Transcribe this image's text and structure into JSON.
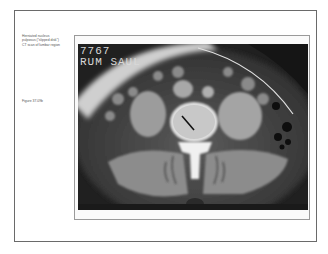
{
  "caption": {
    "lines": [
      "Herniated nucleus",
      "pulposus (\"slipped disk\")",
      "CT scan of lumbar region"
    ]
  },
  "figure": {
    "label": "Figure 37.09b"
  },
  "image": {
    "overlay_line1": "7767",
    "overlay_line2": "RUM  SAUL",
    "description": "Axial CT scan of lumbar spine showing herniated disk with arrow"
  },
  "colors": {
    "border": "#6a6a6a",
    "frame": "#9a9a9a",
    "caption_text": "#555555"
  }
}
